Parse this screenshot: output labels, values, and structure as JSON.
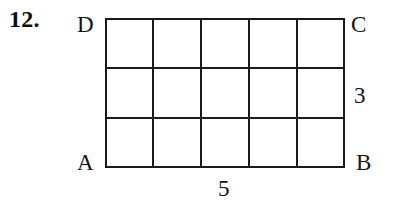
{
  "problem": {
    "number_label": "12."
  },
  "figure": {
    "name": "grid-rectangle",
    "shape_type": "rectangle",
    "columns": 5,
    "rows": 3,
    "grid_visible": true,
    "stroke_color": "#1a1a1a",
    "background_color": "#ffffff",
    "vertices": {
      "top_left": "D",
      "top_right": "C",
      "bottom_left": "A",
      "bottom_right": "B"
    },
    "measurements": {
      "width_label": "5",
      "height_label": "3"
    }
  }
}
